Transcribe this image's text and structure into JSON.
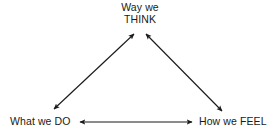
{
  "diagram": {
    "background_color": "#ffffff",
    "line_color": "#1a1a1a",
    "text_color": "#1a1a1a",
    "nodes": {
      "think": {
        "line1": "Way we",
        "line2": "THINK"
      },
      "do": {
        "label": "What we DO"
      },
      "feel": {
        "label": "How we FEEL"
      }
    },
    "connectors": [
      {
        "name": "do-think",
        "from": "What we DO",
        "to": "Way we THINK",
        "style": "double-headed-arrow"
      },
      {
        "name": "think-feel",
        "from": "Way we THINK",
        "to": "How we FEEL",
        "style": "double-headed-arrow"
      },
      {
        "name": "do-feel",
        "from": "What we DO",
        "to": "How we FEEL",
        "style": "double-headed-arrow"
      }
    ]
  }
}
